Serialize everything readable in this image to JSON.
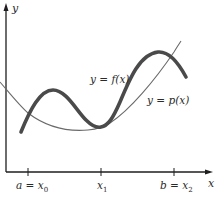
{
  "figure": {
    "axes": {
      "x_label": "x",
      "y_label": "y"
    },
    "curves": {
      "f": {
        "label": "y = f(x)",
        "color": "#4a4a4a"
      },
      "p": {
        "label": "y = p(x)",
        "color": "#6a6a6a"
      }
    },
    "ticks": [
      {
        "label_main": "a = x",
        "label_sub": "0"
      },
      {
        "label_main": "x",
        "label_sub": "1"
      },
      {
        "label_main": "b = x",
        "label_sub": "2"
      }
    ]
  }
}
